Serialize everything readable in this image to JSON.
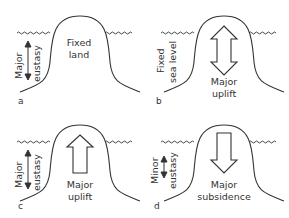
{
  "figure": {
    "panels": [
      {
        "id": "a",
        "letter": "a",
        "side_label": [
          "Major",
          "eustasy"
        ],
        "center_label": [
          "Fixed",
          "land"
        ],
        "side_arrow": "double-thin",
        "center_arrow": "none"
      },
      {
        "id": "b",
        "letter": "b",
        "side_label": [
          "Fixed",
          "sea level"
        ],
        "center_label": [
          "Major",
          "uplift"
        ],
        "side_arrow": "none",
        "center_arrow": "double-hollow"
      },
      {
        "id": "c",
        "letter": "c",
        "side_label": [
          "Major",
          "eustasy"
        ],
        "center_label": [
          "Major",
          "uplift"
        ],
        "side_arrow": "double-thin",
        "center_arrow": "up-hollow"
      },
      {
        "id": "d",
        "letter": "d",
        "side_label": [
          "Minor",
          "eustasy"
        ],
        "center_label": [
          "Major",
          "subsidence"
        ],
        "side_arrow": "double-thin-short",
        "center_arrow": "down-hollow"
      }
    ],
    "colors": {
      "line": "#333333",
      "background": "#ffffff"
    }
  }
}
